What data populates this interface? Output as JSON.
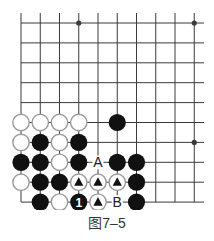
{
  "figure": {
    "caption": "图7–5",
    "colors": {
      "line": "#3a3a3a",
      "black_stone": "#111111",
      "white_stone_fill": "#ffffff",
      "white_stone_edge": "#9a9a9a",
      "background": "#ffffff"
    },
    "grid": {
      "columns": 10,
      "rows": 10,
      "x0": 21,
      "dx": 19.25,
      "y0": 23,
      "dy": 19.9,
      "right_extend_to": 204,
      "top_extend_to": 13,
      "edges": [
        "left",
        "bottom"
      ]
    },
    "star_points": [
      {
        "col": 3,
        "row": 0
      },
      {
        "col": 9,
        "row": 0
      },
      {
        "col": 9,
        "row": 6
      }
    ],
    "stones": [
      {
        "col": 0,
        "row": 5,
        "color": "white"
      },
      {
        "col": 1,
        "row": 5,
        "color": "white"
      },
      {
        "col": 2,
        "row": 5,
        "color": "white"
      },
      {
        "col": 3,
        "row": 5,
        "color": "white"
      },
      {
        "col": 5,
        "row": 5,
        "color": "black"
      },
      {
        "col": 0,
        "row": 6,
        "color": "white"
      },
      {
        "col": 1,
        "row": 6,
        "color": "black"
      },
      {
        "col": 2,
        "row": 6,
        "color": "white"
      },
      {
        "col": 3,
        "row": 6,
        "color": "black"
      },
      {
        "col": 0,
        "row": 7,
        "color": "black"
      },
      {
        "col": 1,
        "row": 7,
        "color": "black"
      },
      {
        "col": 2,
        "row": 7,
        "color": "white"
      },
      {
        "col": 3,
        "row": 7,
        "color": "black"
      },
      {
        "col": 5,
        "row": 7,
        "color": "black"
      },
      {
        "col": 6,
        "row": 7,
        "color": "black"
      },
      {
        "col": 0,
        "row": 8,
        "color": "white"
      },
      {
        "col": 1,
        "row": 8,
        "color": "black"
      },
      {
        "col": 2,
        "row": 8,
        "color": "black"
      },
      {
        "col": 3,
        "row": 8,
        "color": "white",
        "mark": "triangle"
      },
      {
        "col": 4,
        "row": 8,
        "color": "white",
        "mark": "triangle"
      },
      {
        "col": 5,
        "row": 8,
        "color": "white",
        "mark": "triangle"
      },
      {
        "col": 6,
        "row": 8,
        "color": "black"
      },
      {
        "col": 1,
        "row": 9,
        "color": "black"
      },
      {
        "col": 2,
        "row": 9,
        "color": "white"
      },
      {
        "col": 3,
        "row": 9,
        "color": "black",
        "label": "1"
      },
      {
        "col": 4,
        "row": 9,
        "color": "white",
        "mark": "triangle"
      },
      {
        "col": 6,
        "row": 9,
        "color": "black"
      }
    ],
    "point_labels": [
      {
        "col": 4,
        "row": 7,
        "text": "A"
      },
      {
        "col": 5,
        "row": 9,
        "text": "B"
      }
    ]
  }
}
